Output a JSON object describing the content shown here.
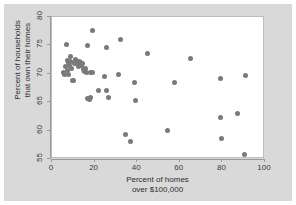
{
  "chart_data": {
    "type": "scatter",
    "title": "",
    "xlabel": "Percent of homes over $100,000",
    "xlabel_line1": "Percent of homes",
    "xlabel_line2": "over $100,000",
    "ylabel": "Percent of households that own their homes",
    "ylabel_line1": "Percent of households",
    "ylabel_line2": "that own their homes",
    "xlim": [
      0,
      100
    ],
    "ylim": [
      55,
      80
    ],
    "xticks": [
      0,
      20,
      40,
      60,
      80,
      100
    ],
    "yticks": [
      55,
      60,
      65,
      70,
      75,
      80
    ],
    "grid": false,
    "legend": null,
    "marker_color": "#7a7a7a",
    "background_color": "#d9d9d9",
    "plot_background_color": "#ffffff",
    "points": [
      [
        5.2,
        70.2
      ],
      [
        5.8,
        69.9
      ],
      [
        6.3,
        71.2
      ],
      [
        6.8,
        75.2
      ],
      [
        7.1,
        72.4
      ],
      [
        7.4,
        70.6
      ],
      [
        7.6,
        69.8
      ],
      [
        7.9,
        72.0
      ],
      [
        8.2,
        71.4
      ],
      [
        8.6,
        73.1
      ],
      [
        8.9,
        72.2
      ],
      [
        9.3,
        70.9
      ],
      [
        9.6,
        68.8
      ],
      [
        10.1,
        68.8
      ],
      [
        10.4,
        71.8
      ],
      [
        10.8,
        72.3
      ],
      [
        11.2,
        72.6
      ],
      [
        11.6,
        71.9
      ],
      [
        12.0,
        72.1
      ],
      [
        12.4,
        71.3
      ],
      [
        12.8,
        72.2
      ],
      [
        13.1,
        71.6
      ],
      [
        13.5,
        72.0
      ],
      [
        13.9,
        71.4
      ],
      [
        14.3,
        71.9
      ],
      [
        14.8,
        70.8
      ],
      [
        15.2,
        70.4
      ],
      [
        15.7,
        71.0
      ],
      [
        16.1,
        70.3
      ],
      [
        16.5,
        74.9
      ],
      [
        16.8,
        65.6
      ],
      [
        17.4,
        65.5
      ],
      [
        17.9,
        70.2
      ],
      [
        18.3,
        65.9
      ],
      [
        18.8,
        77.6
      ],
      [
        19.2,
        70.2
      ],
      [
        21.8,
        67.0
      ],
      [
        24.8,
        69.6
      ],
      [
        25.4,
        74.7
      ],
      [
        25.8,
        67.0
      ],
      [
        26.3,
        65.9
      ],
      [
        31.0,
        69.8
      ],
      [
        32.0,
        76.0
      ],
      [
        34.6,
        59.4
      ],
      [
        37.0,
        58.1
      ],
      [
        38.7,
        68.4
      ],
      [
        39.0,
        65.3
      ],
      [
        44.8,
        73.6
      ],
      [
        54.2,
        60.1
      ],
      [
        57.7,
        68.4
      ],
      [
        65.2,
        72.7
      ],
      [
        79.0,
        69.2
      ],
      [
        79.3,
        62.3
      ],
      [
        79.5,
        58.6
      ],
      [
        87.2,
        63.0
      ],
      [
        90.3,
        55.8
      ],
      [
        91.0,
        69.7
      ]
    ]
  }
}
